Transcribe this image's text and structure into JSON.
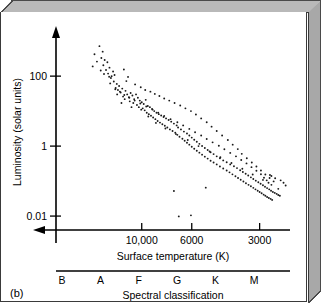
{
  "figure": {
    "panel_label": "(b)"
  },
  "chart_data": {
    "type": "scatter",
    "title": "",
    "xlabel": "Surface temperature (K)",
    "ylabel": "Luminosity (solar units)",
    "xscale": "log-reversed",
    "yscale": "log",
    "xlim": [
      24000,
      2200
    ],
    "ylim": [
      0.004,
      1600
    ],
    "grid": false,
    "legend": null,
    "x_ticks": [
      {
        "value": 10000,
        "label": "10,000"
      },
      {
        "value": 6000,
        "label": "6000"
      },
      {
        "value": 3000,
        "label": "3000"
      }
    ],
    "y_ticks": [
      {
        "value": 100,
        "label": "100"
      },
      {
        "value": 1,
        "label": "1"
      },
      {
        "value": 0.01,
        "label": "0.01"
      }
    ],
    "secondary_axis": {
      "name": "Spectral classification",
      "label": "Spectral classification",
      "categories": [
        "B",
        "A",
        "F",
        "G",
        "K",
        "M"
      ]
    },
    "series": [
      {
        "name": "Stars",
        "marker": "dot",
        "color": "#1a1a1a",
        "points": [
          [
            15400,
            720
          ],
          [
            14900,
            500
          ],
          [
            15100,
            330
          ],
          [
            14600,
            290
          ],
          [
            14200,
            250
          ],
          [
            14800,
            205
          ],
          [
            13900,
            175
          ],
          [
            14400,
            150
          ],
          [
            14100,
            118
          ],
          [
            13600,
            100
          ],
          [
            13950,
            96
          ],
          [
            13700,
            88
          ],
          [
            13400,
            135
          ],
          [
            13200,
            108
          ],
          [
            13800,
            62
          ],
          [
            13300,
            70
          ],
          [
            12900,
            60
          ],
          [
            13050,
            46
          ],
          [
            12600,
            52
          ],
          [
            12750,
            40
          ],
          [
            12400,
            34
          ],
          [
            12200,
            44
          ],
          [
            12850,
            30
          ],
          [
            12100,
            26
          ],
          [
            11800,
            38
          ],
          [
            11600,
            30
          ],
          [
            11900,
            22
          ],
          [
            11400,
            25
          ],
          [
            11200,
            33
          ],
          [
            11000,
            28
          ],
          [
            11300,
            19
          ],
          [
            10800,
            22
          ],
          [
            10600,
            30
          ],
          [
            10400,
            24
          ],
          [
            10900,
            17
          ],
          [
            10200,
            20
          ],
          [
            10500,
            15
          ],
          [
            10000,
            18
          ],
          [
            10300,
            13
          ],
          [
            9800,
            16
          ],
          [
            9600,
            21
          ],
          [
            9900,
            12
          ],
          [
            9400,
            14
          ],
          [
            9700,
            10.5
          ],
          [
            9200,
            13
          ],
          [
            9500,
            9.0
          ],
          [
            9000,
            11.5
          ],
          [
            9300,
            8.2
          ],
          [
            8800,
            10
          ],
          [
            9100,
            7.4
          ],
          [
            8600,
            9.0
          ],
          [
            8900,
            6.6
          ],
          [
            8400,
            8.2
          ],
          [
            8700,
            5.9
          ],
          [
            8200,
            7.5
          ],
          [
            8500,
            5.2
          ],
          [
            8000,
            6.8
          ],
          [
            8300,
            4.7
          ],
          [
            7800,
            6.2
          ],
          [
            8100,
            4.2
          ],
          [
            7600,
            5.6
          ],
          [
            7900,
            3.8
          ],
          [
            7400,
            5.0
          ],
          [
            7700,
            3.4
          ],
          [
            7200,
            4.4
          ],
          [
            7500,
            3.0
          ],
          [
            7000,
            3.9
          ],
          [
            7300,
            2.7
          ],
          [
            6900,
            3.4
          ],
          [
            7100,
            2.4
          ],
          [
            6700,
            3.0
          ],
          [
            6950,
            2.1
          ],
          [
            6500,
            2.6
          ],
          [
            6800,
            1.85
          ],
          [
            6300,
            2.3
          ],
          [
            6600,
            1.62
          ],
          [
            6150,
            2.0
          ],
          [
            6450,
            1.42
          ],
          [
            6000,
            1.75
          ],
          [
            6300,
            1.25
          ],
          [
            5850,
            1.52
          ],
          [
            6150,
            1.1
          ],
          [
            5700,
            1.33
          ],
          [
            6000,
            0.96
          ],
          [
            5550,
            1.16
          ],
          [
            5850,
            0.84
          ],
          [
            5400,
            1.01
          ],
          [
            5700,
            0.74
          ],
          [
            5250,
            0.88
          ],
          [
            5550,
            0.65
          ],
          [
            5100,
            0.77
          ],
          [
            5400,
            0.57
          ],
          [
            4950,
            0.67
          ],
          [
            5250,
            0.5
          ],
          [
            4800,
            0.59
          ],
          [
            5100,
            0.44
          ],
          [
            4650,
            0.51
          ],
          [
            4950,
            0.38
          ],
          [
            4500,
            0.45
          ],
          [
            4800,
            0.34
          ],
          [
            4350,
            0.39
          ],
          [
            4650,
            0.3
          ],
          [
            4200,
            0.345
          ],
          [
            4500,
            0.26
          ],
          [
            4050,
            0.3
          ],
          [
            4350,
            0.23
          ],
          [
            3900,
            0.265
          ],
          [
            4200,
            0.2
          ],
          [
            3780,
            0.235
          ],
          [
            4080,
            0.178
          ],
          [
            3660,
            0.205
          ],
          [
            3960,
            0.156
          ],
          [
            3560,
            0.182
          ],
          [
            3840,
            0.138
          ],
          [
            3460,
            0.162
          ],
          [
            3740,
            0.122
          ],
          [
            3370,
            0.144
          ],
          [
            3640,
            0.109
          ],
          [
            3280,
            0.128
          ],
          [
            3540,
            0.097
          ],
          [
            3200,
            0.115
          ],
          [
            3450,
            0.087
          ],
          [
            3120,
            0.103
          ],
          [
            3360,
            0.078
          ],
          [
            3040,
            0.093
          ],
          [
            3280,
            0.071
          ],
          [
            2970,
            0.084
          ],
          [
            3200,
            0.064
          ],
          [
            2900,
            0.076
          ],
          [
            3130,
            0.058
          ],
          [
            2840,
            0.069
          ],
          [
            3060,
            0.053
          ],
          [
            2780,
            0.063
          ],
          [
            3000,
            0.049
          ],
          [
            2720,
            0.058
          ],
          [
            2940,
            0.045
          ],
          [
            2670,
            0.053
          ],
          [
            2880,
            0.041
          ],
          [
            2620,
            0.049
          ],
          [
            2830,
            0.038
          ],
          [
            2570,
            0.046
          ],
          [
            2780,
            0.035
          ],
          [
            2520,
            0.043
          ],
          [
            2730,
            0.033
          ],
          [
            2480,
            0.04
          ],
          [
            2680,
            0.031
          ],
          [
            2440,
            0.038
          ],
          [
            2640,
            0.029
          ],
          [
            12000,
            155
          ],
          [
            11500,
            95
          ],
          [
            11700,
            72
          ],
          [
            10700,
            58
          ],
          [
            10100,
            48
          ],
          [
            9650,
            40
          ],
          [
            9150,
            36
          ],
          [
            8750,
            31
          ],
          [
            8350,
            27
          ],
          [
            7950,
            23
          ],
          [
            7550,
            20
          ],
          [
            7150,
            17
          ],
          [
            6750,
            14.5
          ],
          [
            6400,
            12.0
          ],
          [
            6050,
            10.0
          ],
          [
            5750,
            8.0
          ],
          [
            5450,
            6.2
          ],
          [
            5150,
            4.8
          ],
          [
            4900,
            3.6
          ],
          [
            4650,
            2.7
          ],
          [
            4400,
            2.0
          ],
          [
            4150,
            1.5
          ],
          [
            3950,
            1.1
          ],
          [
            3750,
            0.82
          ],
          [
            3600,
            0.6
          ],
          [
            3420,
            0.45
          ],
          [
            3250,
            0.34
          ],
          [
            3100,
            0.26
          ],
          [
            2960,
            0.2
          ],
          [
            2830,
            0.155
          ],
          [
            2710,
            0.122
          ],
          [
            2600,
            0.098
          ],
          [
            16200,
            420
          ],
          [
            15800,
            260
          ],
          [
            16500,
            190
          ],
          [
            15200,
            145
          ],
          [
            14700,
            115
          ],
          [
            12300,
            17
          ],
          [
            11100,
            13
          ],
          [
            10050,
            11
          ],
          [
            9350,
            7.0
          ],
          [
            8650,
            4.6
          ],
          [
            7850,
            3.2
          ],
          [
            7050,
            2.2
          ],
          [
            6250,
            1.5
          ],
          [
            5600,
            1.0
          ],
          [
            5000,
            0.7
          ],
          [
            4480,
            0.48
          ],
          [
            4000,
            0.33
          ],
          [
            3580,
            0.225
          ],
          [
            3220,
            0.155
          ],
          [
            2900,
            0.108
          ],
          [
            2660,
            0.078
          ],
          [
            2480,
            0.06
          ],
          [
            13100,
            42
          ],
          [
            12500,
            36
          ],
          [
            11950,
            29
          ],
          [
            11350,
            24
          ],
          [
            10750,
            20
          ],
          [
            10150,
            16.5
          ],
          [
            9550,
            13.5
          ],
          [
            8950,
            11.0
          ],
          [
            8450,
            9.0
          ],
          [
            7950,
            7.3
          ],
          [
            7450,
            5.9
          ],
          [
            6950,
            4.8
          ],
          [
            6550,
            3.9
          ],
          [
            6150,
            3.1
          ],
          [
            5800,
            2.5
          ],
          [
            5450,
            2.0
          ],
          [
            5150,
            1.6
          ],
          [
            4850,
            1.28
          ],
          [
            4550,
            1.02
          ],
          [
            4300,
            0.81
          ],
          [
            4050,
            0.64
          ],
          [
            3820,
            0.51
          ],
          [
            3620,
            0.4
          ],
          [
            3430,
            0.32
          ],
          [
            3260,
            0.25
          ],
          [
            3100,
            0.198
          ],
          [
            2960,
            0.157
          ],
          [
            2870,
            0.125
          ],
          [
            2790,
            0.105
          ],
          [
            2740,
            0.09
          ],
          [
            2700,
            0.15
          ],
          [
            2660,
            0.14
          ],
          [
            2560,
            0.12
          ],
          [
            2420,
            0.105
          ],
          [
            2350,
            0.09
          ],
          [
            2300,
            0.075
          ],
          [
            6050,
            0.0105
          ],
          [
            6850,
            0.0098
          ],
          [
            7200,
            0.052
          ],
          [
            5200,
            0.065
          ]
        ]
      }
    ]
  }
}
